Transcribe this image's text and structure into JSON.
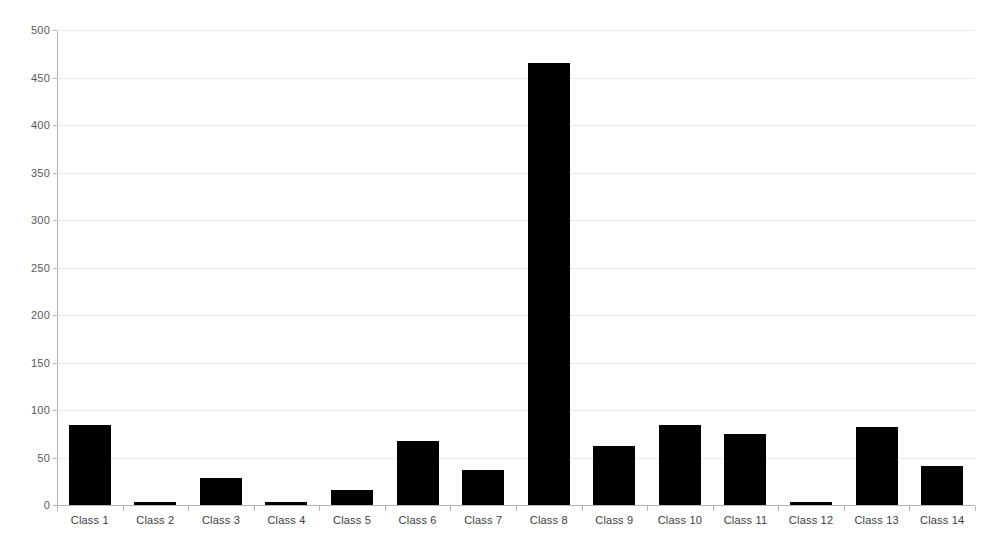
{
  "chart_data": {
    "type": "bar",
    "title": "",
    "subtitle": "",
    "xlabel": "",
    "ylabel": "",
    "categories": [
      "Class 1",
      "Class 2",
      "Class 3",
      "Class 4",
      "Class 5",
      "Class 6",
      "Class 7",
      "Class 8",
      "Class 9",
      "Class 10",
      "Class 11",
      "Class 12",
      "Class 13",
      "Class 14"
    ],
    "values": [
      84,
      3,
      28,
      3,
      16,
      67,
      37,
      465,
      62,
      84,
      75,
      3,
      82,
      41
    ],
    "ylim": [
      0,
      500
    ],
    "ytick_values": [
      0,
      50,
      100,
      150,
      200,
      250,
      300,
      350,
      400,
      450,
      500
    ],
    "ytick_labels": [
      "0",
      "50",
      "100",
      "150",
      "200",
      "250",
      "300",
      "350",
      "400",
      "450",
      "500"
    ],
    "grid": true,
    "grid_axis": "y",
    "legend": false,
    "legend_position": "none",
    "bar_color": "#000000",
    "grid_color": "#ececed",
    "axis_color": "#b4b4b6",
    "tick_label_color": "#5a5a5c",
    "background_color": "#ffffff"
  }
}
